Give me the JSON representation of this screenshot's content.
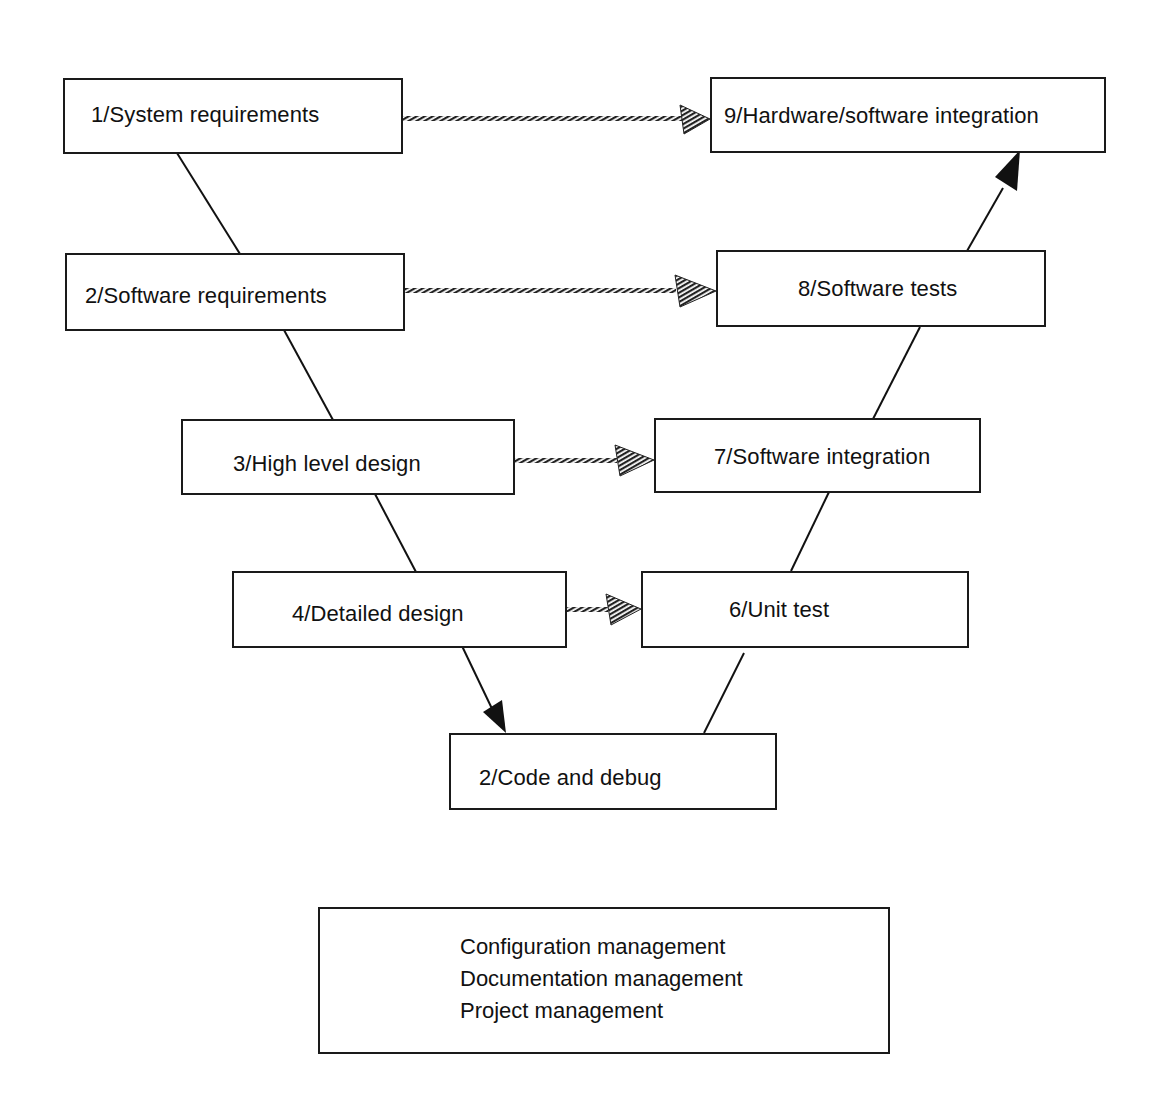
{
  "diagram": {
    "type": "V-model software development lifecycle",
    "boxes": [
      {
        "id": "b1",
        "label": "1/System requirements"
      },
      {
        "id": "b2",
        "label": "2/Software requirements"
      },
      {
        "id": "b3",
        "label": "3/High level design"
      },
      {
        "id": "b4",
        "label": "4/Detailed design"
      },
      {
        "id": "b5",
        "label": "2/Code and debug"
      },
      {
        "id": "b6",
        "label": "6/Unit test"
      },
      {
        "id": "b7",
        "label": "7/Software integration"
      },
      {
        "id": "b8",
        "label": "8/Software tests"
      },
      {
        "id": "b9",
        "label": "9/Hardware/software integration"
      }
    ],
    "edges": [
      {
        "from": "b1",
        "to": "b2",
        "style": "solid-line"
      },
      {
        "from": "b2",
        "to": "b3",
        "style": "solid-line"
      },
      {
        "from": "b3",
        "to": "b4",
        "style": "solid-line"
      },
      {
        "from": "b4",
        "to": "b5",
        "style": "solid-arrow"
      },
      {
        "from": "b5",
        "to": "b6",
        "style": "solid-line"
      },
      {
        "from": "b6",
        "to": "b7",
        "style": "solid-line"
      },
      {
        "from": "b7",
        "to": "b8",
        "style": "solid-line"
      },
      {
        "from": "b8",
        "to": "b9",
        "style": "solid-arrow"
      },
      {
        "from": "b1",
        "to": "b9",
        "style": "hatched-arrow"
      },
      {
        "from": "b2",
        "to": "b8",
        "style": "hatched-arrow"
      },
      {
        "from": "b3",
        "to": "b7",
        "style": "hatched-arrow"
      },
      {
        "from": "b4",
        "to": "b6",
        "style": "hatched-arrow"
      }
    ],
    "management": {
      "lines": [
        "Configuration management",
        "Documentation management",
        "Project management"
      ]
    }
  }
}
